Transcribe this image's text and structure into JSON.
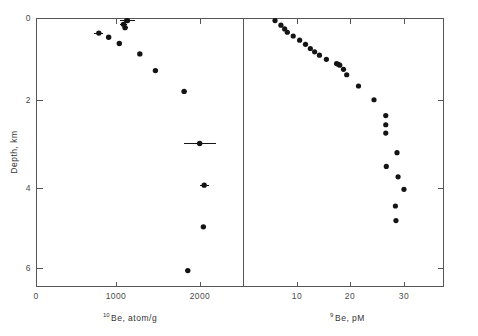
{
  "figure": {
    "background_color": "#ffffff",
    "frame_color": "#565656",
    "marker_color": "#141414"
  },
  "left_panel": {
    "xlabel_sup": "10",
    "xlabel_main": "Be, atom/g",
    "xlabel_full": "10Be, atom/g",
    "ylabel": "Depth, km",
    "x_ticklabels": [
      "0",
      "1000",
      "2000"
    ],
    "y_ticklabels": [
      "0",
      "2",
      "4",
      "6"
    ]
  },
  "right_panel": {
    "xlabel_sup": "9",
    "xlabel_main": "Be, pM",
    "xlabel_full": "9Be, pM",
    "x_ticklabels": [
      "10",
      "20",
      "30"
    ]
  },
  "chart_data": [
    {
      "type": "scatter",
      "panel": "left",
      "title": "",
      "xlabel": "10Be, atom/g",
      "ylabel": "Depth, km",
      "xlim": [
        0,
        2450
      ],
      "ylim": [
        0,
        6.6
      ],
      "y_inverted": true,
      "xticks": [
        0,
        1000,
        2000
      ],
      "yticks": [
        0,
        2,
        4,
        6
      ],
      "grid": false,
      "legend": "none",
      "x": [
        1100,
        1110,
        1060,
        1080,
        760,
        880,
        1010,
        1260,
        1450,
        1800,
        1990,
        2045,
        2035,
        1845
      ],
      "y": [
        0.05,
        0.05,
        0.14,
        0.22,
        0.35,
        0.45,
        0.6,
        0.85,
        1.25,
        1.75,
        3.0,
        4.0,
        5.0,
        6.05
      ],
      "xerr": [
        60,
        90,
        40,
        30,
        55,
        20,
        20,
        25,
        25,
        30,
        195,
        55,
        35,
        30
      ]
    },
    {
      "type": "scatter",
      "panel": "right",
      "title": "",
      "xlabel": "9Be, pM",
      "ylabel": "Depth, km",
      "xlim": [
        0,
        43
      ],
      "ylim": [
        0,
        6.6
      ],
      "y_inverted": true,
      "xticks": [
        10,
        20,
        30
      ],
      "yticks": [
        0,
        2,
        4,
        6
      ],
      "grid": false,
      "legend": "none",
      "x": [
        5.8,
        6.9,
        7.6,
        8.1,
        9.2,
        10.4,
        11.5,
        12.4,
        13.2,
        14.1,
        15.4,
        17.3,
        17.6,
        17.9,
        18.6,
        19.2,
        21.4,
        24.3,
        26.5,
        26.5,
        26.5,
        28.6,
        26.6,
        28.8,
        29.9,
        28.3,
        28.4
      ],
      "y": [
        0.05,
        0.16,
        0.25,
        0.33,
        0.42,
        0.52,
        0.62,
        0.72,
        0.8,
        0.88,
        0.98,
        1.08,
        1.1,
        1.12,
        1.22,
        1.35,
        1.62,
        1.95,
        2.33,
        2.55,
        2.75,
        3.22,
        3.55,
        3.8,
        4.1,
        4.5,
        4.85
      ]
    }
  ]
}
